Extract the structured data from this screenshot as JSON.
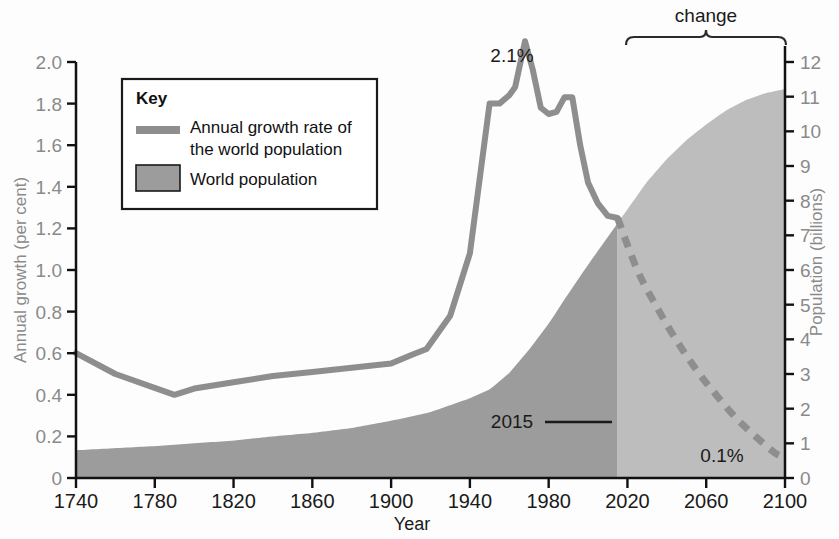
{
  "chart_data": {
    "type": "line",
    "title": "",
    "xlabel": "Year",
    "ylabel": "Annual growth (per cent)",
    "y2label": "Population (billions)",
    "xlim": [
      1740,
      2100
    ],
    "ylim": [
      0,
      2.0
    ],
    "y2lim": [
      0,
      12
    ],
    "grid": false,
    "legend_position": "upper-left-inset",
    "x_ticks": [
      "1740",
      "1780",
      "1820",
      "1860",
      "1900",
      "1940",
      "1980",
      "2020",
      "2060",
      "2100"
    ],
    "x_tick_values": [
      1740,
      1780,
      1820,
      1860,
      1900,
      1940,
      1980,
      2020,
      2060,
      2100
    ],
    "y_ticks": [
      "0",
      "0.2",
      "0.4",
      "0.6",
      "0.8",
      "1.0",
      "1.2",
      "1.4",
      "1.6",
      "1.8",
      "2.0"
    ],
    "y_tick_values": [
      0,
      0.2,
      0.4,
      0.6,
      0.8,
      1.0,
      1.2,
      1.4,
      1.6,
      1.8,
      2.0
    ],
    "y2_ticks": [
      "0",
      "1",
      "2",
      "3",
      "4",
      "5",
      "6",
      "7",
      "8",
      "9",
      "10",
      "11",
      "12"
    ],
    "y2_tick_values": [
      0,
      1,
      2,
      3,
      4,
      5,
      6,
      7,
      8,
      9,
      10,
      11,
      12
    ],
    "split_year": 2015,
    "series": [
      {
        "name": "Annual growth rate of the world population",
        "kind": "line",
        "axis": "left",
        "color": "#8e8e8e",
        "historical_x": [
          1740,
          1760,
          1790,
          1800,
          1820,
          1840,
          1860,
          1880,
          1900,
          1910,
          1918,
          1930,
          1940,
          1950,
          1955,
          1960,
          1963,
          1968,
          1972,
          1976,
          1980,
          1984,
          1988,
          1992,
          1996,
          2000,
          2005,
          2010,
          2015
        ],
        "historical_y": [
          0.6,
          0.5,
          0.4,
          0.43,
          0.46,
          0.49,
          0.51,
          0.53,
          0.55,
          0.59,
          0.62,
          0.78,
          1.08,
          1.8,
          1.8,
          1.84,
          1.88,
          2.1,
          1.96,
          1.78,
          1.75,
          1.76,
          1.83,
          1.83,
          1.6,
          1.42,
          1.32,
          1.26,
          1.25
        ],
        "projected_x": [
          2015,
          2025,
          2035,
          2045,
          2055,
          2065,
          2075,
          2085,
          2095,
          2100
        ],
        "projected_y": [
          1.25,
          1.0,
          0.82,
          0.66,
          0.52,
          0.4,
          0.29,
          0.2,
          0.12,
          0.1
        ],
        "style_historical": "solid",
        "style_projected": "dashed"
      },
      {
        "name": "World population",
        "kind": "area",
        "axis": "right",
        "color_historical": "#9c9c9c",
        "color_projected": "#bdbdbd",
        "x": [
          1740,
          1780,
          1800,
          1820,
          1840,
          1860,
          1880,
          1900,
          1920,
          1940,
          1950,
          1960,
          1970,
          1980,
          1990,
          2000,
          2010,
          2015,
          2020,
          2030,
          2040,
          2050,
          2060,
          2070,
          2080,
          2090,
          2100
        ],
        "y": [
          0.8,
          0.92,
          1.0,
          1.08,
          1.2,
          1.3,
          1.44,
          1.65,
          1.9,
          2.3,
          2.55,
          3.03,
          3.7,
          4.45,
          5.32,
          6.15,
          6.95,
          7.35,
          7.75,
          8.55,
          9.2,
          9.75,
          10.2,
          10.6,
          10.9,
          11.1,
          11.22
        ],
        "fill_from": 0
      }
    ],
    "annotations": [
      {
        "name": "peak-growth-label",
        "text": "2.1%",
        "x": 1968,
        "y": 2.1,
        "anchor": "above"
      },
      {
        "name": "end-growth-label",
        "text": "0.1%",
        "x": 2080,
        "y": 0.12,
        "anchor": "right"
      },
      {
        "name": "split-year-label",
        "text": "2015",
        "x": 2015,
        "y": 0.3,
        "anchor": "left-leader"
      },
      {
        "name": "projection-bracket-label",
        "text": "change",
        "x_start": 2015,
        "x_end": 2100,
        "anchor": "top-bracket"
      }
    ]
  },
  "legend": {
    "title": "Key",
    "items": [
      {
        "label_line1": "Annual growth rate of",
        "label_line2": "the world population",
        "swatch": "line",
        "color": "#8e8e8e"
      },
      {
        "label_line1": "World population",
        "label_line2": "",
        "swatch": "box",
        "color": "#9c9c9c"
      }
    ]
  },
  "axes": {
    "left_title": "Annual growth (per cent)",
    "right_title": "Population (billions)",
    "bottom_title": "Year"
  },
  "colors": {
    "line": "#8e8e8e",
    "area_historical": "#9c9c9c",
    "area_projected": "#bdbdbd",
    "axis": "#111111",
    "tick_text_y": "#8a8a8a",
    "tick_text_x": "#1a1a1a"
  }
}
